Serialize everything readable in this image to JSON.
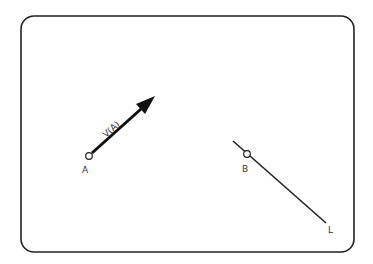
{
  "diagram": {
    "frame": {
      "x": 21,
      "y": 16,
      "width": 333,
      "height": 236,
      "radius": 13,
      "stroke": "#222222"
    },
    "point_a": {
      "label": "A",
      "cx": 89,
      "cy": 156,
      "r": 3.5
    },
    "vector": {
      "label": "V(A)",
      "from": [
        91,
        154
      ],
      "to": [
        155,
        96
      ],
      "color": "#111111"
    },
    "line_l": {
      "label": "L",
      "from": [
        233,
        141
      ],
      "to": [
        326,
        223
      ],
      "color": "#222222"
    },
    "point_b": {
      "label": "B",
      "cx": 247,
      "cy": 154,
      "r": 3.5
    }
  }
}
